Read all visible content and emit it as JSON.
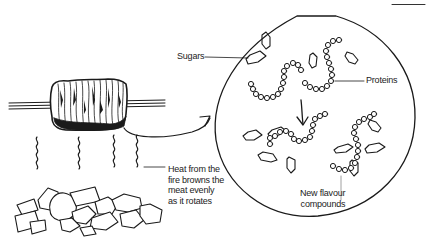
{
  "diagram": {
    "labels": {
      "sugars": "Sugars",
      "proteins": "Proteins",
      "heat": [
        "Heat from the",
        "fire browns the",
        "meat evenly",
        "as it rotates"
      ],
      "new_compounds": [
        "New flavour",
        "compounds"
      ]
    },
    "elements": {
      "meat": "meat-on-spit",
      "heat_waves": 4,
      "fire": "burning-coals",
      "magnified_circle": "molecular-view",
      "reaction_arrow": "down-arrow"
    },
    "colors": {
      "ink": "#1a1a1a",
      "text": "#222222",
      "background": "#ffffff"
    }
  }
}
